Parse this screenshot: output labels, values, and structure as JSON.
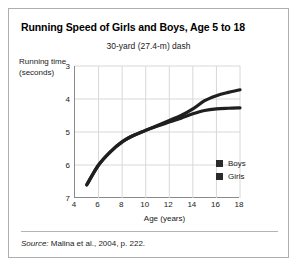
{
  "figure": {
    "title": "Running Speed of Girls and Boys, Age 5 to 18",
    "subtitle": "30-yard (27.4-m) dash",
    "source_prefix": "Source:",
    "source_text": " Malina et al., 2004, p. 222."
  },
  "chart_data": {
    "type": "line",
    "title": "Running Speed of Girls and Boys, Age 5 to 18",
    "subtitle": "30-yard (27.4-m) dash",
    "xlabel": "Age (years)",
    "ylabel": "Running time (seconds)",
    "xlim": [
      4,
      18
    ],
    "ylim": [
      3,
      7
    ],
    "y_inverted": true,
    "grid": true,
    "legend_position": "inside-bottom-right",
    "xticks": [
      4,
      6,
      8,
      10,
      12,
      14,
      16,
      18
    ],
    "yticks": [
      3,
      4,
      5,
      6,
      7
    ],
    "x": [
      5,
      6,
      7,
      8,
      9,
      10,
      11,
      12,
      13,
      14,
      15,
      16,
      17,
      18
    ],
    "series": [
      {
        "name": "Boys",
        "color": "#1f1f1f",
        "values": [
          6.6,
          6.0,
          5.6,
          5.3,
          5.1,
          4.95,
          4.8,
          4.65,
          4.5,
          4.3,
          4.05,
          3.9,
          3.8,
          3.72
        ]
      },
      {
        "name": "Girls",
        "color": "#1f1f1f",
        "values": [
          6.6,
          6.0,
          5.6,
          5.3,
          5.1,
          4.95,
          4.82,
          4.7,
          4.58,
          4.45,
          4.35,
          4.3,
          4.28,
          4.27
        ]
      }
    ]
  },
  "legend": {
    "items": [
      {
        "label": "Boys",
        "color": "#2a2a2a"
      },
      {
        "label": "Girls",
        "color": "#2a2a2a"
      }
    ]
  }
}
